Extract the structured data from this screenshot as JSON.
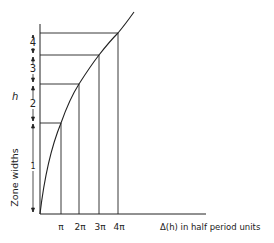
{
  "diagram": {
    "y_axis_symbol": "h",
    "y_axis_label": "Zone widths",
    "x_axis_label": "Δ(h) in half period units",
    "zones": [
      {
        "label": "1"
      },
      {
        "label": "2"
      },
      {
        "label": "3"
      },
      {
        "label": "4"
      }
    ],
    "x_ticks": [
      {
        "label": "π"
      },
      {
        "label": "2π"
      },
      {
        "label": "3π"
      },
      {
        "label": "4π"
      }
    ],
    "colors": {
      "ink": "#222222",
      "background": "#ffffff"
    }
  }
}
